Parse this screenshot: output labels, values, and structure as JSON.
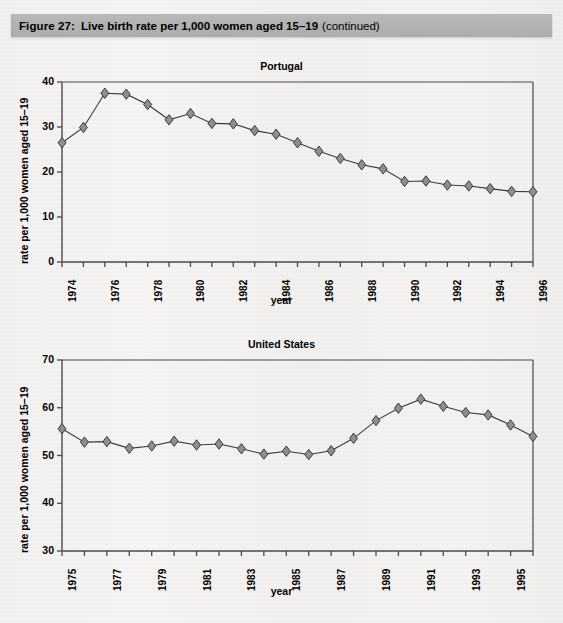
{
  "header": {
    "figure_number": "Figure 27:",
    "title": "Live birth rate per 1,000 women aged 15–19",
    "continued": "(continued)",
    "bar_color": "#b3b3b3"
  },
  "page": {
    "background_color": "#f4f3f1",
    "marker_fill": "#8f8f8f",
    "line_color": "#3a3a3a",
    "axis_color": "#4a4a4a"
  },
  "chart_data": [
    {
      "id": "portugal",
      "type": "line",
      "title": "Portugal",
      "xlabel": "year",
      "ylabel": "rate per 1,000 women aged 15–19",
      "xlim": [
        1974,
        1996
      ],
      "ylim": [
        0,
        40
      ],
      "yticks": [
        0,
        10,
        20,
        30,
        40
      ],
      "ytick_labels": [
        "0",
        "10",
        "20",
        "30",
        "40"
      ],
      "xticks": [
        1974,
        1975,
        1976,
        1977,
        1978,
        1979,
        1980,
        1981,
        1982,
        1983,
        1984,
        1985,
        1986,
        1987,
        1988,
        1989,
        1990,
        1991,
        1992,
        1993,
        1994,
        1995,
        1996
      ],
      "xtick_labels": [
        "1974",
        "",
        "1976",
        "",
        "1978",
        "",
        "1980",
        "",
        "1982",
        "",
        "1984",
        "",
        "1986",
        "",
        "1988",
        "",
        "1990",
        "",
        "1992",
        "",
        "1994",
        "",
        "1996"
      ],
      "grid": false,
      "legend": "none",
      "marker": "diamond",
      "x": [
        1974,
        1975,
        1976,
        1977,
        1978,
        1979,
        1980,
        1981,
        1982,
        1983,
        1984,
        1985,
        1986,
        1987,
        1988,
        1989,
        1990,
        1991,
        1992,
        1993,
        1994,
        1995,
        1996
      ],
      "values": [
        26.5,
        29.9,
        37.5,
        37.3,
        35.0,
        31.6,
        33.0,
        30.8,
        30.7,
        29.2,
        28.4,
        26.5,
        24.6,
        23.0,
        21.6,
        20.7,
        17.9,
        18.0,
        17.1,
        16.9,
        16.3,
        15.7,
        15.6
      ]
    },
    {
      "id": "united-states",
      "type": "line",
      "title": "United States",
      "xlabel": "year",
      "ylabel": "rate per 1,000 women aged 15–19",
      "xlim": [
        1975,
        1996
      ],
      "ylim": [
        30,
        70
      ],
      "yticks": [
        30,
        40,
        50,
        60,
        70
      ],
      "ytick_labels": [
        "30",
        "40",
        "50",
        "60",
        "70"
      ],
      "xticks": [
        1975,
        1976,
        1977,
        1978,
        1979,
        1980,
        1981,
        1982,
        1983,
        1984,
        1985,
        1986,
        1987,
        1988,
        1989,
        1990,
        1991,
        1992,
        1993,
        1994,
        1995,
        1996
      ],
      "xtick_labels": [
        "1975",
        "",
        "1977",
        "",
        "1979",
        "",
        "1981",
        "",
        "1983",
        "",
        "1985",
        "",
        "1987",
        "",
        "1989",
        "",
        "1991",
        "",
        "1993",
        "",
        "1995",
        ""
      ],
      "grid": false,
      "legend": "none",
      "marker": "diamond",
      "x": [
        1975,
        1976,
        1977,
        1978,
        1979,
        1980,
        1981,
        1982,
        1983,
        1984,
        1985,
        1986,
        1987,
        1988,
        1989,
        1990,
        1991,
        1992,
        1993,
        1994,
        1995,
        1996
      ],
      "values": [
        55.6,
        52.8,
        52.9,
        51.5,
        52.0,
        53.0,
        52.2,
        52.4,
        51.4,
        50.3,
        50.9,
        50.2,
        51.0,
        53.6,
        57.3,
        59.9,
        61.8,
        60.3,
        59.0,
        58.5,
        56.4,
        54.0
      ]
    }
  ]
}
